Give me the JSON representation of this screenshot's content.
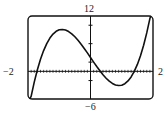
{
  "chart_data": {
    "type": "line",
    "title": "",
    "xlabel": "",
    "ylabel": "",
    "xlim": [
      -2,
      2
    ],
    "ylim": [
      -6,
      12
    ],
    "grid": false,
    "legend": null,
    "window_labels": {
      "xmin": "−2",
      "xmax": "2",
      "ymin": "−6",
      "ymax": "12"
    },
    "x_tick_step": 0.1,
    "y_tick_step": 4,
    "series": [
      {
        "name": "f(x)",
        "color": "#111111",
        "x": [
          -1.9,
          -1.8,
          -1.7,
          -1.6,
          -1.5,
          -1.4,
          -1.3,
          -1.2,
          -1.1,
          -1.0,
          -0.9,
          -0.8,
          -0.7,
          -0.6,
          -0.5,
          -0.4,
          -0.3,
          -0.2,
          -0.1,
          0.0,
          0.1,
          0.2,
          0.3,
          0.4,
          0.5,
          0.6,
          0.7,
          0.8,
          0.9,
          1.0,
          1.1,
          1.2,
          1.3,
          1.4,
          1.5,
          1.6,
          1.7,
          1.8,
          1.9
        ],
        "y": [
          -5.44,
          -2.33,
          0.35,
          2.62,
          4.5,
          6.02,
          7.21,
          8.09,
          8.68,
          9.0,
          9.08,
          8.95,
          8.63,
          8.14,
          7.5,
          6.74,
          5.89,
          4.97,
          4.0,
          3.0,
          2.0,
          1.03,
          0.11,
          -0.74,
          -1.5,
          -2.14,
          -2.63,
          -2.95,
          -3.08,
          -3.0,
          -2.68,
          -2.09,
          -1.21,
          -0.02,
          1.5,
          3.38,
          5.65,
          8.33,
          11.44
        ]
      }
    ]
  }
}
